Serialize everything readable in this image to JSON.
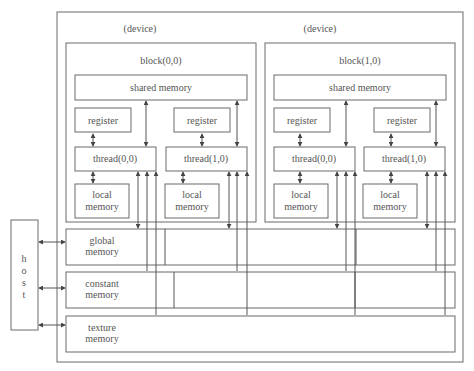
{
  "figure_title": "……………………模型",
  "device_labels": [
    "(device)",
    "(device)"
  ],
  "blocks": [
    {
      "label": "block(0,0)",
      "shared_memory": "shared memory",
      "threads": [
        {
          "register": "register",
          "thread": "thread(0,0)",
          "local": [
            "local",
            "memory"
          ]
        },
        {
          "register": "register",
          "thread": "thread(1,0)",
          "local": [
            "local",
            "memory"
          ]
        }
      ]
    },
    {
      "label": "block(1,0)",
      "shared_memory": "shared memory",
      "threads": [
        {
          "register": "register",
          "thread": "thread(0,0)",
          "local": [
            "local",
            "memory"
          ]
        },
        {
          "register": "register",
          "thread": "thread(1,0)",
          "local": [
            "local",
            "memory"
          ]
        }
      ]
    }
  ],
  "memories": [
    {
      "id": "global",
      "lines": [
        "global",
        "memory"
      ]
    },
    {
      "id": "constant",
      "lines": [
        "constant",
        "memory"
      ]
    },
    {
      "id": "texture",
      "lines": [
        "texture",
        "memory"
      ]
    }
  ],
  "host": {
    "letters": [
      "h",
      "o",
      "s",
      "t"
    ]
  }
}
